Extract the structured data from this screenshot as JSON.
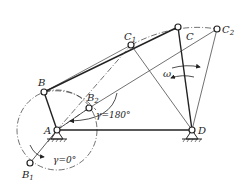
{
  "figure": {
    "type": "four-bar linkage diagram",
    "colors": {
      "stroke": "#222222",
      "background": "#ffffff"
    },
    "joints": {
      "A": {
        "label": "A",
        "x": 57,
        "y": 130
      },
      "B": {
        "label": "B",
        "x": 44,
        "y": 92
      },
      "B1": {
        "label": "B",
        "sub": "1",
        "x": 30,
        "y": 163
      },
      "B2": {
        "label": "B",
        "sub": "2",
        "x": 89,
        "y": 108
      },
      "C": {
        "label": "C",
        "x": 178,
        "y": 27
      },
      "C1": {
        "label": "C",
        "sub": "1",
        "x": 131,
        "y": 45
      },
      "C2": {
        "label": "C",
        "sub": "2",
        "x": 217,
        "y": 29
      },
      "D": {
        "label": "D",
        "x": 192,
        "y": 130
      }
    },
    "annotations": {
      "gamma_180": "γ=180°",
      "gamma_0": "γ=0°",
      "omega": "ω"
    }
  }
}
